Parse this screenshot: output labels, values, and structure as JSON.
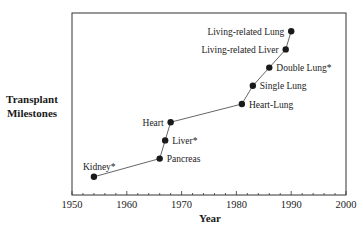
{
  "chart_data": {
    "type": "line",
    "title": "",
    "xlabel": "Year",
    "ylabel": "Transplant Milestones",
    "xlim": [
      1950,
      2000
    ],
    "xticks": [
      1950,
      1960,
      1970,
      1980,
      1990,
      2000
    ],
    "x_minor_tick_step": 2,
    "ylim": [
      0,
      10
    ],
    "y_ticks_shown": false,
    "grid": false,
    "legend": null,
    "points": [
      {
        "label": "Kidney*",
        "year": 1954,
        "rank": 1,
        "label_pos": "above-left"
      },
      {
        "label": "Pancreas",
        "year": 1966,
        "rank": 2,
        "label_pos": "right"
      },
      {
        "label": "Liver*",
        "year": 1967,
        "rank": 3,
        "label_pos": "right"
      },
      {
        "label": "Heart",
        "year": 1968,
        "rank": 4,
        "label_pos": "left"
      },
      {
        "label": "Heart-Lung",
        "year": 1981,
        "rank": 5,
        "label_pos": "right"
      },
      {
        "label": "Single Lung",
        "year": 1983,
        "rank": 6,
        "label_pos": "right"
      },
      {
        "label": "Double Lung*",
        "year": 1986,
        "rank": 7,
        "label_pos": "right"
      },
      {
        "label": "Living-related Liver",
        "year": 1989,
        "rank": 8,
        "label_pos": "left"
      },
      {
        "label": "Living-related Lung",
        "year": 1990,
        "rank": 9,
        "label_pos": "left"
      }
    ],
    "x": [
      1954,
      1966,
      1967,
      1968,
      1981,
      1983,
      1986,
      1989,
      1990
    ],
    "values": [
      1,
      2,
      3,
      4,
      5,
      6,
      7,
      8,
      9
    ],
    "colors": {
      "line": "#555555",
      "marker": "#1a1a1a",
      "frame": "#333333"
    }
  },
  "axis": {
    "ylabel_line1": "Transplant",
    "ylabel_line2": "Milestones",
    "xlabel": "Year"
  }
}
